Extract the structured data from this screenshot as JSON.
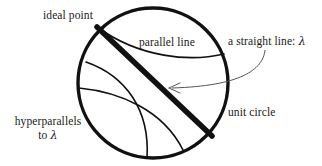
{
  "figure": {
    "width": 322,
    "height": 166,
    "background_color": "#ffffff",
    "stroke_color": "#111111",
    "text_color": "#1a1a1a",
    "annotation_color": "#555555"
  },
  "labels": {
    "ideal_point": "ideal point",
    "parallel_line": "parallel line",
    "straight_line": "a straight line: ",
    "straight_line_symbol": "λ",
    "unit_circle": "unit circle",
    "hyperparallels_line1": "hyperparallels",
    "hyperparallels_line2_prefix": "to ",
    "hyperparallels_line2_symbol": "λ"
  },
  "geometry": {
    "unit_circle": {
      "center_x": 153,
      "center_y": 83,
      "radius": 75,
      "stroke_width": 3.4
    },
    "straight_line_lambda": {
      "type": "chord",
      "x1": 97,
      "y1": 27,
      "x2": 212,
      "y2": 136,
      "stroke_width": 5.5
    },
    "parallel_line_arc": {
      "type": "arc",
      "x1": 97,
      "y1": 27,
      "x2": 224,
      "y2": 54,
      "stroke_width": 1.6
    },
    "hyperparallel_arcs": [
      {
        "type": "arc",
        "x1": 86,
        "y1": 62,
        "x2": 147,
        "y2": 158,
        "stroke_width": 1.6
      },
      {
        "type": "arc",
        "x1": 79,
        "y1": 88,
        "x2": 183,
        "y2": 150,
        "stroke_width": 1.6
      }
    ],
    "annotation_arrow": {
      "from_x": 265,
      "from_y": 50,
      "to_x": 170,
      "to_y": 88,
      "stroke_width": 1.0,
      "points_to": "straight_line_lambda"
    }
  }
}
